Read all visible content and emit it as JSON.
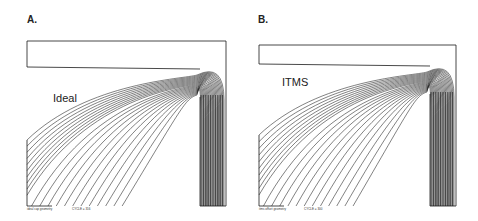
{
  "panels": [
    {
      "id": "A",
      "label": "A.",
      "title": "Ideal",
      "caption_left": "ideal cap geometry",
      "caption_right": "CYCLE = 316"
    },
    {
      "id": "B",
      "label": "B.",
      "title": "ITMS",
      "caption_left": "itms offset geometry",
      "caption_right": "CYCLE = 300"
    }
  ],
  "colors": {
    "line": "#1a1a1a",
    "background": "#ffffff"
  }
}
